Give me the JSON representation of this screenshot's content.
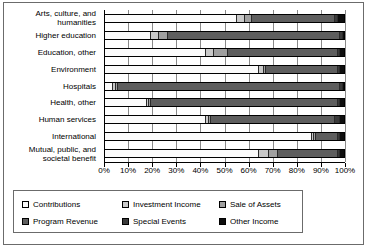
{
  "chart_data": {
    "type": "bar",
    "orientation": "horizontal",
    "stacked": "100%",
    "title": "",
    "xlabel": "",
    "ylabel": "",
    "xlim": [
      0,
      100
    ],
    "xticks": [
      "0%",
      "10%",
      "20%",
      "30%",
      "40%",
      "50%",
      "60%",
      "70%",
      "80%",
      "90%",
      "100%"
    ],
    "grid": true,
    "legend_position": "bottom",
    "categories": [
      "Arts, culture, and\nhumanities",
      "Higher education",
      "Education, other",
      "Environment",
      "Hospitals",
      "Health, other",
      "Human services",
      "International",
      "Mutual, public, and\nsocietal benefit"
    ],
    "series": [
      {
        "name": "Contributions",
        "color": "#fbfbfb",
        "values": [
          55,
          19,
          42,
          64,
          3,
          17,
          42,
          86,
          64
        ]
      },
      {
        "name": "Investment Income",
        "color": "#c9c9c9",
        "values": [
          3,
          3,
          3,
          2,
          1,
          1,
          1,
          1,
          4
        ]
      },
      {
        "name": "Sale of Assets",
        "color": "#a0a0a0",
        "values": [
          3,
          4,
          6,
          1,
          1,
          1,
          1,
          1,
          4
        ]
      },
      {
        "name": "Program Revenue",
        "color": "#5e5e5e",
        "values": [
          35,
          72,
          46,
          30,
          93,
          78,
          52,
          9,
          25
        ]
      },
      {
        "name": "Special Events",
        "color": "#3a3a3a",
        "values": [
          1,
          1,
          1,
          1,
          1,
          1,
          2,
          1,
          1
        ]
      },
      {
        "name": "Other Income",
        "color": "#0d0d0d",
        "values": [
          3,
          1,
          2,
          2,
          1,
          2,
          2,
          2,
          2
        ]
      }
    ]
  },
  "legend": {
    "items": [
      {
        "label": "Contributions"
      },
      {
        "label": "Investment Income"
      },
      {
        "label": "Sale of Assets"
      },
      {
        "label": "Program Revenue"
      },
      {
        "label": "Special Events"
      },
      {
        "label": "Other Income"
      }
    ]
  }
}
